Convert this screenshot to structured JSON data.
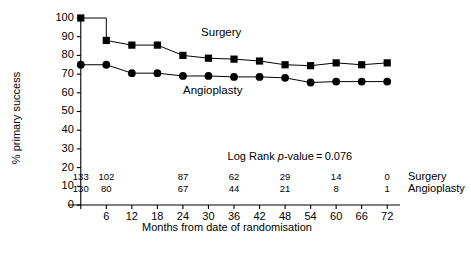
{
  "chart_data": {
    "type": "line",
    "title": "",
    "xlabel": "Months from date of randomisation",
    "ylabel": "% primary success",
    "x": [
      0,
      6,
      12,
      18,
      24,
      30,
      36,
      42,
      48,
      54,
      60,
      66,
      72
    ],
    "xticks": [
      0,
      6,
      12,
      18,
      24,
      30,
      36,
      42,
      48,
      54,
      60,
      66,
      72
    ],
    "xticklabels": [
      "",
      "6",
      "12",
      "18",
      "24",
      "30",
      "36",
      "42",
      "48",
      "54",
      "60",
      "66",
      "72"
    ],
    "yticks": [
      0,
      10,
      20,
      30,
      40,
      50,
      60,
      70,
      80,
      90,
      100
    ],
    "yticklabels": [
      "0",
      "10",
      "20",
      "30",
      "40",
      "50",
      "60",
      "70",
      "80",
      "90",
      "100"
    ],
    "xlim": [
      -3,
      75
    ],
    "ylim": [
      0,
      102
    ],
    "grid": false,
    "legend_position": "inline-annotation",
    "series": [
      {
        "name": "Surgery",
        "marker": "square",
        "color": "#000000",
        "values": [
          100,
          88,
          85.5,
          85.5,
          80,
          78.5,
          78,
          77,
          75,
          74.5,
          76,
          75,
          76
        ]
      },
      {
        "name": "Angioplasty",
        "marker": "circle",
        "color": "#000000",
        "values": [
          75,
          75,
          70.5,
          70.5,
          69,
          69,
          68.5,
          68.5,
          68,
          65.5,
          66,
          66,
          66
        ]
      }
    ],
    "annotations": [
      {
        "name": "logrank",
        "text_prefix": "Log Rank ",
        "text_italic": "p",
        "text_suffix": "-value = 0.076"
      }
    ],
    "numbers_at_risk": {
      "label_surgery": "Surgery",
      "label_angioplasty": "Angioplasty",
      "x_positions": [
        0,
        6,
        12,
        18,
        24,
        30,
        36,
        42,
        48,
        54,
        60,
        66,
        72
      ],
      "surgery": [
        "133",
        "102",
        "",
        "",
        "87",
        "",
        "62",
        "",
        "29",
        "",
        "14",
        "",
        "0"
      ],
      "angioplasty": [
        "130",
        "80",
        "",
        "",
        "67",
        "",
        "44",
        "",
        "21",
        "",
        "8",
        "",
        "1"
      ]
    },
    "series_inline_labels": [
      {
        "name": "Surgery",
        "x": 33,
        "y": 90.5
      },
      {
        "name": "Angioplasty",
        "x": 31,
        "y": 59.5
      }
    ]
  }
}
